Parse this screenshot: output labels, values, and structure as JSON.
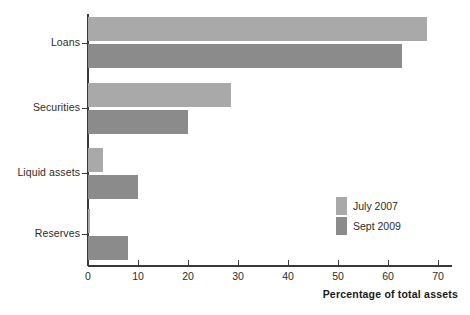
{
  "chart_data": {
    "type": "bar",
    "orientation": "horizontal",
    "title": "",
    "xlabel": "Percentage of total assets",
    "ylabel": "",
    "categories": [
      "Loans",
      "Securities",
      "Liquid assets",
      "Reserves"
    ],
    "series": [
      {
        "name": "July 2007",
        "color": "#a9a9a9",
        "values": [
          67.8,
          28.6,
          3.0,
          0.3
        ]
      },
      {
        "name": "Sept 2009",
        "color": "#8b8b8b",
        "values": [
          62.8,
          20.0,
          10.0,
          8.0
        ]
      }
    ],
    "xlim": [
      0,
      73
    ],
    "xticks": [
      "0",
      "10",
      "20",
      "30",
      "40",
      "50",
      "60",
      "70"
    ],
    "xtick_values": [
      0,
      10,
      20,
      30,
      40,
      50,
      60,
      70
    ],
    "grid": false,
    "legend_position": "inside-lower-right"
  },
  "axis": {
    "x_title": "Percentage of total assets"
  },
  "legend": {
    "entries": [
      {
        "label": "July 2007",
        "color": "#a9a9a9"
      },
      {
        "label": "Sept 2009",
        "color": "#8b8b8b"
      }
    ]
  }
}
